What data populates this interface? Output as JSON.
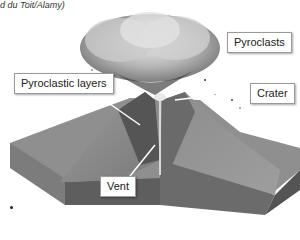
{
  "credit": "d du Toit/Alamy)",
  "diagram": {
    "labels": {
      "pyroclasts": "Pyroclasts",
      "pyroclastic_layers": "Pyroclastic layers",
      "crater": "Crater",
      "vent": "Vent"
    }
  },
  "colors": {
    "block_top": "#8a8a8a",
    "block_side": "#6a6a6a",
    "cloud": "#b5b5b5",
    "label_border": "#9a9a9a"
  }
}
